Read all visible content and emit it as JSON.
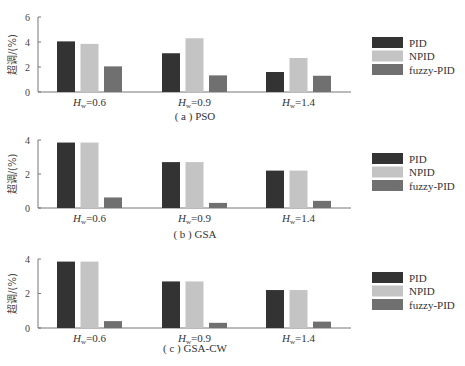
{
  "colors": {
    "PID": "#333333",
    "NPID": "#c4c4c4",
    "fuzzy-PID": "#707070",
    "axis": "#777777"
  },
  "legend": [
    "PID",
    "NPID",
    "fuzzy-PID"
  ],
  "y_axis_label": "超调/(%)",
  "category_prefix": "H",
  "category_subscript": "w",
  "chart_data": [
    {
      "type": "bar",
      "title": "(a) PSO",
      "caption_letter": "a",
      "caption_name": "PSO",
      "ylabel": "超调/(%)",
      "xlabel": "",
      "categories": [
        "Hw=0.6",
        "Hw=0.9",
        "Hw=1.4"
      ],
      "category_values": [
        "0.6",
        "0.9",
        "1.4"
      ],
      "ylim": [
        0,
        6
      ],
      "yticks": [
        0,
        2,
        4,
        6
      ],
      "legend_position": "right",
      "grid": false,
      "series": [
        {
          "name": "PID",
          "values": [
            4.05,
            3.1,
            1.6
          ]
        },
        {
          "name": "NPID",
          "values": [
            3.85,
            4.3,
            2.72
          ]
        },
        {
          "name": "fuzzy-PID",
          "values": [
            2.05,
            1.33,
            1.3
          ]
        }
      ]
    },
    {
      "type": "bar",
      "title": "(b) GSA",
      "caption_letter": "b",
      "caption_name": "GSA",
      "ylabel": "超调/(%)",
      "xlabel": "",
      "categories": [
        "Hw=0.6",
        "Hw=0.9",
        "Hw=1.4"
      ],
      "category_values": [
        "0.6",
        "0.9",
        "1.4"
      ],
      "ylim": [
        0,
        4
      ],
      "yticks": [
        0,
        2,
        4
      ],
      "legend_position": "right",
      "grid": false,
      "series": [
        {
          "name": "PID",
          "values": [
            3.85,
            2.7,
            2.2
          ]
        },
        {
          "name": "NPID",
          "values": [
            3.85,
            2.7,
            2.2
          ]
        },
        {
          "name": "fuzzy-PID",
          "values": [
            0.62,
            0.3,
            0.42
          ]
        }
      ]
    },
    {
      "type": "bar",
      "title": "(c) GSA-CW",
      "caption_letter": "c",
      "caption_name": "GSA-CW",
      "ylabel": "超调/(%)",
      "xlabel": "",
      "categories": [
        "Hw=0.6",
        "Hw=0.9",
        "Hw=1.4"
      ],
      "category_values": [
        "0.6",
        "0.9",
        "1.4"
      ],
      "ylim": [
        0,
        4
      ],
      "yticks": [
        0,
        2,
        4
      ],
      "legend_position": "right",
      "grid": false,
      "series": [
        {
          "name": "PID",
          "values": [
            3.85,
            2.7,
            2.2
          ]
        },
        {
          "name": "NPID",
          "values": [
            3.85,
            2.7,
            2.2
          ]
        },
        {
          "name": "fuzzy-PID",
          "values": [
            0.4,
            0.3,
            0.37
          ]
        }
      ]
    }
  ]
}
